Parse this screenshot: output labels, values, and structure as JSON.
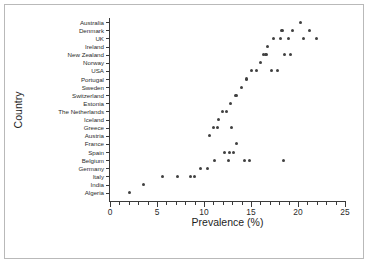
{
  "chart_data": {
    "type": "scatter",
    "title": "",
    "xlabel": "Prevalence (%)",
    "ylabel": "Country",
    "xlim": [
      0,
      25
    ],
    "ylim_categories_order": "top_to_bottom",
    "grid": false,
    "legend": null,
    "xticks": [
      0,
      5,
      10,
      15,
      20,
      25
    ],
    "xtick_labels": [
      "0",
      "5",
      "10",
      "15",
      "20",
      "25"
    ],
    "x_minor_tick_step": 1,
    "marker": "filled-circle",
    "marker_color": "#404040",
    "categories": [
      "Australia",
      "Denmark",
      "UK",
      "Ireland",
      "New Zealand",
      "Norway",
      "USA",
      "Portugal",
      "Sweden",
      "Switzerland",
      "Estonia",
      "The Netherlands",
      "Iceland",
      "Greece",
      "Austria",
      "France",
      "Spain",
      "Belgium",
      "Germany",
      "Italy",
      "India",
      "Algeria"
    ],
    "points": [
      {
        "country": "Australia",
        "x": 20.3
      },
      {
        "country": "Denmark",
        "x": 18.3
      },
      {
        "country": "Denmark",
        "x": 19.4
      },
      {
        "country": "Denmark",
        "x": 21.2
      },
      {
        "country": "UK",
        "x": 17.4
      },
      {
        "country": "UK",
        "x": 18.1
      },
      {
        "country": "UK",
        "x": 19.0
      },
      {
        "country": "UK",
        "x": 20.6
      },
      {
        "country": "UK",
        "x": 22.0
      },
      {
        "country": "Ireland",
        "x": 16.8
      },
      {
        "country": "New Zealand",
        "x": 16.3
      },
      {
        "country": "New Zealand",
        "x": 16.6
      },
      {
        "country": "New Zealand",
        "x": 18.6
      },
      {
        "country": "New Zealand",
        "x": 19.2
      },
      {
        "country": "Norway",
        "x": 16.0
      },
      {
        "country": "USA",
        "x": 15.1
      },
      {
        "country": "USA",
        "x": 15.6
      },
      {
        "country": "USA",
        "x": 17.2
      },
      {
        "country": "USA",
        "x": 17.8
      },
      {
        "country": "Portugal",
        "x": 14.5
      },
      {
        "country": "Sweden",
        "x": 14.0
      },
      {
        "country": "Switzerland",
        "x": 13.4
      },
      {
        "country": "Estonia",
        "x": 12.8
      },
      {
        "country": "The Netherlands",
        "x": 12.0
      },
      {
        "country": "The Netherlands",
        "x": 12.4
      },
      {
        "country": "Iceland",
        "x": 11.5
      },
      {
        "country": "Greece",
        "x": 11.0
      },
      {
        "country": "Greece",
        "x": 11.4
      },
      {
        "country": "Greece",
        "x": 12.9
      },
      {
        "country": "Austria",
        "x": 10.6
      },
      {
        "country": "France",
        "x": 13.5
      },
      {
        "country": "Spain",
        "x": 12.2
      },
      {
        "country": "Spain",
        "x": 12.7
      },
      {
        "country": "Spain",
        "x": 13.1
      },
      {
        "country": "Belgium",
        "x": 11.1
      },
      {
        "country": "Belgium",
        "x": 12.6
      },
      {
        "country": "Belgium",
        "x": 14.3
      },
      {
        "country": "Belgium",
        "x": 14.8
      },
      {
        "country": "Belgium",
        "x": 18.5
      },
      {
        "country": "Germany",
        "x": 10.4
      },
      {
        "country": "Germany",
        "x": 9.6
      },
      {
        "country": "Italy",
        "x": 7.2
      },
      {
        "country": "Italy",
        "x": 8.6
      },
      {
        "country": "Italy",
        "x": 9.0
      },
      {
        "country": "Italy",
        "x": 5.6
      },
      {
        "country": "India",
        "x": 3.6
      },
      {
        "country": "Algeria",
        "x": 2.1
      }
    ]
  },
  "axes": {
    "x_title": "Prevalence (%)",
    "y_title": "Country"
  }
}
